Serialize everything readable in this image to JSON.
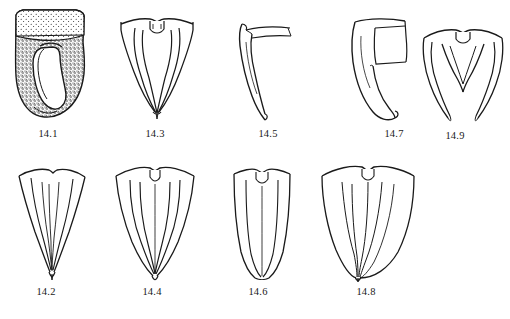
{
  "plate": {
    "type": "scientific-illustration-plate",
    "subject": "line drawings of insect terminalia / genitalic structures",
    "background_color": "#ffffff",
    "ink_color": "#1a1a1a",
    "rows": 2,
    "figure_count": 9
  },
  "figures": [
    {
      "id": "14.1",
      "label": "14.1",
      "row": 1,
      "column": 1,
      "style": "stippled dark body with broad flared apex and inner loop",
      "label_x": 48,
      "label_y": 134
    },
    {
      "id": "14.3",
      "label": "14.3",
      "row": 1,
      "column": 2,
      "style": "outline of paired curved lobes with median notch",
      "label_x": 155,
      "label_y": 134
    },
    {
      "id": "14.5",
      "label": "14.5",
      "row": 1,
      "column": 3,
      "style": "lateral view of single hooked curved process",
      "label_x": 268,
      "label_y": 134
    },
    {
      "id": "14.7",
      "label": "14.7",
      "row": 1,
      "column": 4,
      "style": "lateral view with rectangular plate and broad curved hook",
      "label_x": 394,
      "label_y": 134
    },
    {
      "id": "14.9",
      "label": "14.9",
      "row": 1,
      "column": 5,
      "style": "outline with paired divergent arms and central arch",
      "label_x": 455,
      "label_y": 136
    },
    {
      "id": "14.2",
      "label": "14.2",
      "row": 2,
      "column": 1,
      "style": "narrow elongate tapering outline with internal striations",
      "label_x": 45,
      "label_y": 292
    },
    {
      "id": "14.4",
      "label": "14.4",
      "row": 2,
      "column": 2,
      "style": "broad outline tapering to point with paired inner lobes",
      "label_x": 152,
      "label_y": 292
    },
    {
      "id": "14.6",
      "label": "14.6",
      "row": 2,
      "column": 3,
      "style": "narrow parallel-sided outline with median notch at top",
      "label_x": 258,
      "label_y": 292
    },
    {
      "id": "14.8",
      "label": "14.8",
      "row": 2,
      "column": 4,
      "style": "broad rounded outline with converging inner lines to apex",
      "label_x": 366,
      "label_y": 292
    }
  ]
}
